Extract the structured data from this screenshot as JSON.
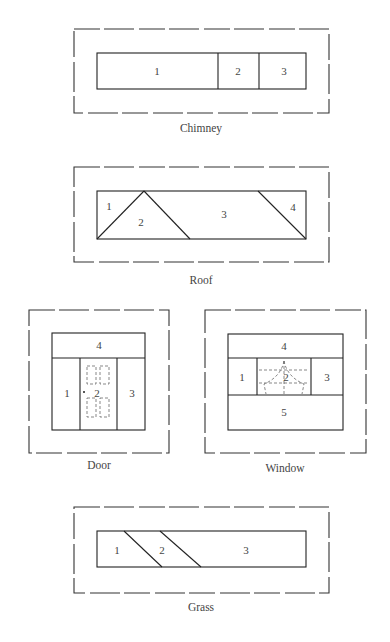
{
  "diagrams": {
    "chimney": {
      "caption": "Chimney",
      "regions": [
        "1",
        "2",
        "3"
      ]
    },
    "roof": {
      "caption": "Roof",
      "regions": [
        "1",
        "2",
        "3",
        "4"
      ]
    },
    "door": {
      "caption": "Door",
      "regions": [
        "1",
        "2",
        "3",
        "4"
      ]
    },
    "window": {
      "caption": "Window",
      "regions": [
        "1",
        "2",
        "3",
        "4",
        "5"
      ]
    },
    "grass": {
      "caption": "Grass",
      "regions": [
        "1",
        "2",
        "3"
      ]
    }
  },
  "colors": {
    "line": "#222222",
    "text": "#444444",
    "background": "#ffffff"
  }
}
